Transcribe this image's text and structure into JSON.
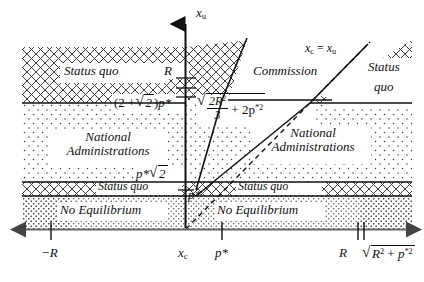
{
  "figure": {
    "type": "diagram",
    "kind": "phase-regions-plot",
    "axes": {
      "y_axis_label": "x_u",
      "y_axis_label_base": "x",
      "y_axis_label_sub": "u",
      "x_tick_labels": [
        "−R",
        "x_c",
        "p*",
        "R",
        "√(R² + p*²)"
      ],
      "x_tick_minus_R": "−R",
      "x_tick_xc_base": "x",
      "x_tick_xc_sub": "c",
      "x_tick_pstar": "p*",
      "x_tick_R": "R",
      "x_tick_sqrt_inner_R": "R",
      "x_tick_sqrt_inner_p": "p",
      "x_tick_sqrt_sup_R": "2",
      "x_tick_sqrt_sup_p": "*2",
      "x_tick_sqrt_plus": "+"
    },
    "y_levels": {
      "level_R_label": "R",
      "level_two_plus_sqrt2_pstar": "(2 + √2 )p*",
      "level_two_plus_sqrt2_open": "(2 +",
      "level_two_plus_sqrt2_two": "2",
      "level_two_plus_sqrt2_close": ")",
      "level_two_plus_sqrt2_p": "p*",
      "level_pstar_sqrt2_p": "p*",
      "level_pstar_sqrt2_two": "2",
      "level_pstar_origin": "p*"
    },
    "curve_labels": {
      "commission": "Commission",
      "identity_line_base_c": "x",
      "identity_line_sub_c": "c",
      "identity_line_eq": "=",
      "identity_line_base_u": "x",
      "identity_line_sub_u": "u",
      "sqrt_expr_num": "2R",
      "sqrt_expr_num_sup": "2",
      "sqrt_expr_den": "3",
      "sqrt_expr_plus": "+ 2p",
      "sqrt_expr_sup": "*2"
    },
    "regions": [
      {
        "name": "status-quo-top-left",
        "label": "Status quo",
        "pattern": "crosshatch"
      },
      {
        "name": "national-admin-left",
        "label": "National Administrations",
        "pattern": "dots-sparse"
      },
      {
        "name": "status-quo-band-left",
        "label": "Status quo",
        "pattern": "crosshatch"
      },
      {
        "name": "no-equilibrium-left",
        "label": "No Equilibrium",
        "pattern": "dots-dense"
      },
      {
        "name": "national-admin-right",
        "label": "National Administrations",
        "pattern": "dots-sparse"
      },
      {
        "name": "status-quo-band-right",
        "label": "Status quo",
        "pattern": "crosshatch"
      },
      {
        "name": "no-equilibrium-right",
        "label": "No Equilibrium",
        "pattern": "dots-dense"
      },
      {
        "name": "status-quo-top-right",
        "label": "Status quo",
        "pattern": "crosshatch"
      }
    ],
    "region_text": {
      "status_quo": "Status quo",
      "national_line1": "National",
      "national_line2": "Administrations",
      "no_equilibrium": "No Equilibrium",
      "status_quo_right_line1": "Status",
      "status_quo_right_line2": "quo"
    },
    "colors": {
      "ink": "#111111",
      "axis": "#555555",
      "background": "#ffffff"
    }
  }
}
